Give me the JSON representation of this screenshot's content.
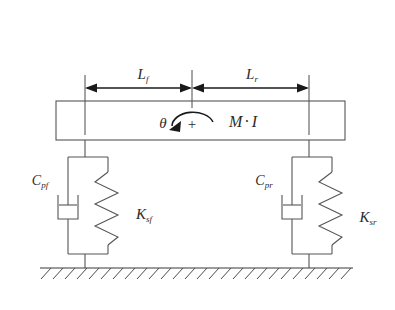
{
  "figure": {
    "background_color": "#ffffff",
    "line_color": "#555555",
    "dimension_color": "#1a1a1a",
    "text_color": "#2b2b2b"
  },
  "dimensions": {
    "front": {
      "symbol": "L",
      "subscript": "f",
      "label": "L_f",
      "description": "distance from center of gravity to front suspension"
    },
    "rear": {
      "symbol": "L",
      "subscript": "r",
      "label": "L_r",
      "description": "distance from center of gravity to rear suspension"
    }
  },
  "body": {
    "rotation_symbol": "θ",
    "positive_sign": "+",
    "mass_inertia": {
      "mass_symbol": "M",
      "separator": "·",
      "inertia_symbol": "I",
      "label": "M · I"
    },
    "rotation_direction": "counterclockwise-positive"
  },
  "suspensions": [
    {
      "position": "front",
      "damper": {
        "symbol": "C",
        "subscript": "pf",
        "label": "C_pf",
        "type": "viscous-damper"
      },
      "spring": {
        "symbol": "K",
        "subscript": "sf",
        "label": "K_sf",
        "type": "coil-spring",
        "coils": 4
      }
    },
    {
      "position": "rear",
      "damper": {
        "symbol": "C",
        "subscript": "pr",
        "label": "C_pr",
        "type": "viscous-damper"
      },
      "spring": {
        "symbol": "K",
        "subscript": "sr",
        "label": "K_sr",
        "type": "coil-spring",
        "coils": 4
      }
    }
  ],
  "ground": {
    "label": "fixed-ground",
    "hatch_count": 26,
    "style": "hatched-baseline"
  }
}
